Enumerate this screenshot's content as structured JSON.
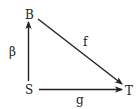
{
  "diagram": {
    "type": "commutative-diagram",
    "colors": {
      "stroke": "#222222",
      "background": "#ffffff"
    },
    "nodes": [
      {
        "id": "B",
        "label": "B",
        "x": 29,
        "y": 15
      },
      {
        "id": "S",
        "label": "S",
        "x": 29,
        "y": 90
      },
      {
        "id": "T",
        "label": "T",
        "x": 129,
        "y": 90
      }
    ],
    "edges": [
      {
        "from": "S",
        "to": "B",
        "label": "β"
      },
      {
        "from": "B",
        "to": "T",
        "label": "f"
      },
      {
        "from": "S",
        "to": "T",
        "label": "g"
      }
    ]
  }
}
